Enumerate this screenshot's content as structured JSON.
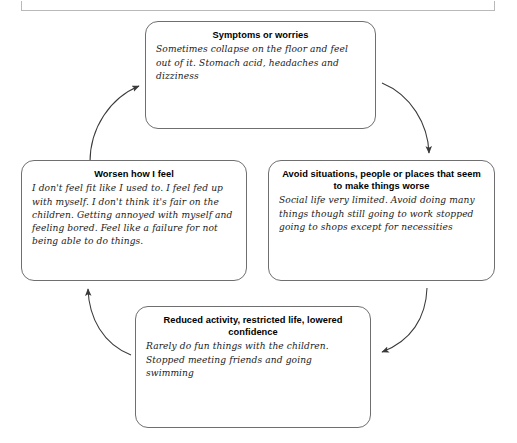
{
  "diagram": {
    "type": "vicious-cycle",
    "direction": "clockwise",
    "nodes": [
      {
        "id": "symptoms",
        "title": "Symptoms or worries",
        "body": "Sometimes collapse on the floor and feel out of it. Stomach acid, headaches and dizziness"
      },
      {
        "id": "avoid",
        "title": "Avoid situations, people or places that seem to make things worse",
        "body": "Social life very limited. Avoid doing many things though still going to work stopped going to shops except for necessities"
      },
      {
        "id": "reduced",
        "title": "Reduced activity, restricted life, lowered confidence",
        "body": "Rarely do fun things with the children. Stopped meeting friends and going swimming"
      },
      {
        "id": "worsen",
        "title": "Worsen how I feel",
        "body": "I don't feel fit like I used to. I feel fed up with myself. I don't think it's fair on the children. Getting annoyed with myself and feeling bored. Feel like a failure for not being able to do things."
      }
    ],
    "arrows": [
      {
        "id": "worsen-to-symptoms",
        "from": "worsen",
        "to": "symptoms"
      },
      {
        "id": "symptoms-to-avoid",
        "from": "symptoms",
        "to": "avoid"
      },
      {
        "id": "avoid-to-reduced",
        "from": "avoid",
        "to": "reduced"
      },
      {
        "id": "reduced-to-worsen",
        "from": "reduced",
        "to": "worsen"
      }
    ],
    "colors": {
      "box_border": "#6f6f6f",
      "arrow": "#3a3a3a",
      "title_text": "#000000",
      "body_text": "#1a1a1a",
      "background": "#ffffff"
    }
  }
}
